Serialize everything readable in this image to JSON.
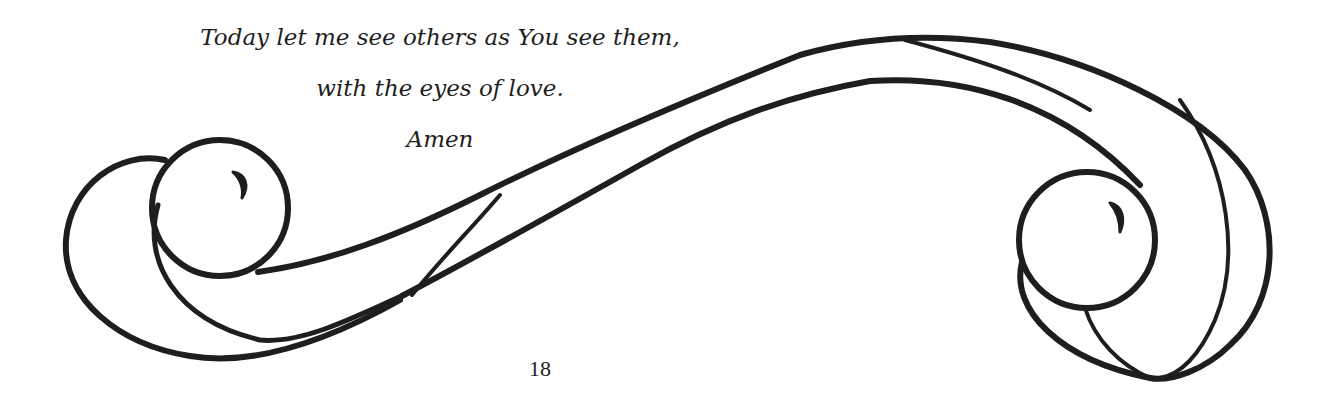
{
  "prayer": {
    "lines": [
      "Today let me see others as You see them,",
      "with the eyes of love.",
      "Amen"
    ]
  },
  "page_number": "18",
  "colors": {
    "ink": "#1e1e1e",
    "paper": "#ffffff"
  }
}
